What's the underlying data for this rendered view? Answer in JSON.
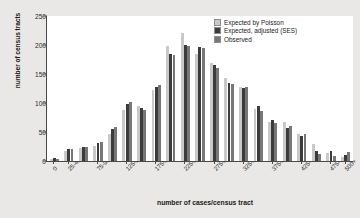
{
  "chart_data": {
    "type": "bar",
    "title": "",
    "xlabel": "number of cases/census tract",
    "ylabel": "number of census tracts",
    "ylim": [
      0,
      250
    ],
    "yticks": [
      0,
      50,
      100,
      150,
      200,
      250
    ],
    "grid": false,
    "legend_position": "top-right",
    "bar_group_mode": "grouped",
    "categories": [
      "0-24",
      "25-49",
      "50-74",
      "75-99",
      "100-124",
      "125-149",
      "150-174",
      "175-199",
      "200-224",
      "225-249",
      "250-274",
      "275-299",
      "300-324",
      "325-349",
      "350-374",
      "375-399",
      "400-424",
      "425-449",
      "450-474",
      "475-499",
      "500+"
    ],
    "xtick_labels": [
      "0",
      "25-49",
      "75-99",
      "125-149",
      "175-199",
      "225-249",
      "275-299",
      "325-349",
      "375-399",
      "425-449",
      "475-499",
      "500+"
    ],
    "xtick_category_index": [
      0,
      1,
      3,
      5,
      7,
      9,
      11,
      13,
      15,
      17,
      19,
      20
    ],
    "series": [
      {
        "name": "Expected by Poisson",
        "color": "#c9c9c9",
        "values": [
          3,
          18,
          22,
          26,
          47,
          88,
          94,
          122,
          199,
          220,
          185,
          169,
          143,
          128,
          90,
          68,
          67,
          47,
          30,
          14,
          7
        ]
      },
      {
        "name": "Expected, adjusted (SES)",
        "color": "#3b3b3b",
        "values": [
          5,
          20,
          24,
          31,
          55,
          98,
          92,
          128,
          184,
          200,
          196,
          166,
          135,
          126,
          94,
          70,
          57,
          43,
          17,
          18,
          10
        ]
      },
      {
        "name": "Observed",
        "color": "#777777",
        "values": [
          4,
          21,
          25,
          32,
          58,
          101,
          88,
          131,
          183,
          199,
          194,
          160,
          132,
          128,
          86,
          66,
          61,
          46,
          12,
          8,
          16
        ]
      }
    ]
  },
  "legend": {
    "items": [
      {
        "label": "Expected by Poisson",
        "color": "#c9c9c9"
      },
      {
        "label": "Expected, adjusted (SES)",
        "color": "#3b3b3b"
      },
      {
        "label": "Observed",
        "color": "#777777"
      }
    ]
  }
}
